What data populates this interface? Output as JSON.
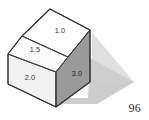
{
  "figure": {
    "name": "isometric-stepped-prism",
    "background_color": "#ffffff",
    "outline_color": "#3a3a3a",
    "shadow_color": "#c9c9c9",
    "faces": [
      {
        "id": "top-slope",
        "name": "top-sloped-face",
        "label": "1.0",
        "fill": "#ffffff",
        "label_x": 60,
        "label_y": 33
      },
      {
        "id": "mid-step",
        "name": "middle-step-face",
        "label": "1.5",
        "fill": "#fcfcfc",
        "label_x": 35,
        "label_y": 52
      },
      {
        "id": "left-lower",
        "name": "lower-left-face",
        "label": "2.0",
        "fill": "#f2f2f2",
        "label_x": 30,
        "label_y": 80
      },
      {
        "id": "right-side",
        "name": "right-side-face",
        "label": "3.0",
        "fill": "#9a9a9a",
        "label_x": 77,
        "label_y": 76
      }
    ]
  },
  "page": {
    "number": "96"
  }
}
